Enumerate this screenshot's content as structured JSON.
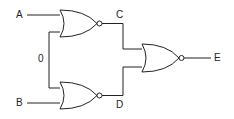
{
  "diagram": {
    "type": "logic-circuit",
    "gates": [
      {
        "id": "gate1",
        "kind": "NOR",
        "inputs": [
          "A",
          "0"
        ],
        "output": "C"
      },
      {
        "id": "gate2",
        "kind": "NOR",
        "inputs": [
          "0",
          "B"
        ],
        "output": "D"
      },
      {
        "id": "gate3",
        "kind": "NOR",
        "inputs": [
          "C",
          "D"
        ],
        "output": "E"
      }
    ],
    "labels": {
      "a": "A",
      "b": "B",
      "zero": "0",
      "c": "C",
      "d": "D",
      "e": "E"
    },
    "colors": {
      "stroke": "#222222",
      "background": "#ffffff"
    }
  }
}
